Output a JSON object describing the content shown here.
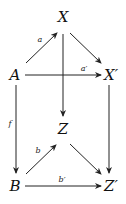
{
  "diagram": {
    "type": "commutative-diagram",
    "nodes": {
      "X": "X",
      "A": "A",
      "Xp": "X′",
      "Z": "Z",
      "B": "B",
      "Zp": "Z′"
    },
    "edges": [
      {
        "from": "A",
        "to": "X",
        "label": "a"
      },
      {
        "from": "X",
        "to": "X′",
        "label": ""
      },
      {
        "from": "A",
        "to": "X′",
        "label": "a′"
      },
      {
        "from": "X",
        "to": "Z",
        "label": ""
      },
      {
        "from": "A",
        "to": "B",
        "label": "f"
      },
      {
        "from": "X′",
        "to": "Z′",
        "label": ""
      },
      {
        "from": "B",
        "to": "Z",
        "label": "b"
      },
      {
        "from": "Z",
        "to": "Z′",
        "label": ""
      },
      {
        "from": "B",
        "to": "Z′",
        "label": "b′"
      }
    ],
    "labels": {
      "a": "a",
      "ap": "a′",
      "f": "f",
      "b": "b",
      "bp": "b′"
    }
  }
}
